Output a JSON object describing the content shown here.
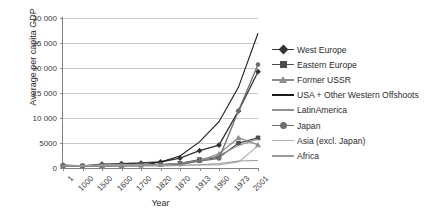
{
  "chart_data": {
    "type": "line",
    "title": "",
    "xlabel": "Year",
    "ylabel": "Average per capita GDP",
    "categories": [
      "1",
      "1000",
      "1500",
      "1600",
      "1700",
      "1820",
      "1870",
      "1913",
      "1950",
      "1973",
      "2001"
    ],
    "ylim": [
      0,
      30000
    ],
    "yticks": [
      0,
      5000,
      10000,
      15000,
      20000,
      25000,
      30000
    ],
    "ytick_labels": [
      "0",
      "5000",
      "10 000",
      "15 000",
      "20 000",
      "25 000",
      "30 000"
    ],
    "grid": "horizontal",
    "legend_position": "right",
    "series": [
      {
        "name": "West Europe",
        "marker": "diamond",
        "color": "#333333",
        "values": [
          576,
          427,
          771,
          889,
          997,
          1202,
          1960,
          3457,
          4578,
          11416,
          19256
        ]
      },
      {
        "name": "Eastern Europe",
        "marker": "square",
        "color": "#4d4d4d",
        "values": [
          412,
          400,
          496,
          548,
          606,
          683,
          937,
          1695,
          2111,
          4988,
          6027
        ]
      },
      {
        "name": "Former USSR",
        "marker": "triangle",
        "color": "#8c8c8c",
        "values": [
          400,
          400,
          499,
          552,
          610,
          688,
          943,
          1488,
          2841,
          6059,
          4626
        ]
      },
      {
        "name": "USA + Other Western Offshoots",
        "marker": "none",
        "color": "#1a1a1a",
        "values": [
          400,
          400,
          400,
          400,
          476,
          1202,
          2419,
          5233,
          9268,
          16179,
          26943
        ]
      },
      {
        "name": "LatinAmerica",
        "marker": "none",
        "color": "#8f8f8f",
        "values": [
          400,
          400,
          416,
          438,
          527,
          691,
          676,
          1494,
          2503,
          4504,
          5811
        ]
      },
      {
        "name": "Japan",
        "marker": "circle",
        "color": "#6e6e6e",
        "values": [
          400,
          425,
          500,
          520,
          570,
          669,
          737,
          1387,
          1921,
          11434,
          20683
        ]
      },
      {
        "name": "Asia (excl. Japan)",
        "marker": "none",
        "color": "#b0b0b0",
        "values": [
          450,
          450,
          572,
          576,
          572,
          577,
          548,
          658,
          634,
          1226,
          4434
        ]
      },
      {
        "name": "Africa",
        "marker": "none",
        "color": "#9a9a9a",
        "values": [
          472,
          425,
          414,
          422,
          421,
          420,
          500,
          637,
          894,
          1410,
          1489
        ]
      }
    ]
  },
  "legend": {
    "items": [
      {
        "label": "West Europe"
      },
      {
        "label": "Eastern Europe"
      },
      {
        "label": "Former USSR"
      },
      {
        "label": "USA + Other Western Offshoots"
      },
      {
        "label": "LatinAmerica"
      },
      {
        "label": "Japan"
      },
      {
        "label": "Asia (excl. Japan)"
      },
      {
        "label": "Africa"
      }
    ]
  }
}
